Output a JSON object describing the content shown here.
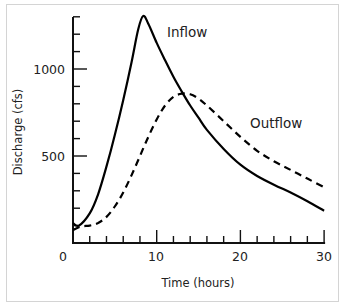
{
  "chart_data": {
    "type": "line",
    "title": "",
    "xlabel": "Time (hours)",
    "ylabel": "Discharge (cfs)",
    "xlim": [
      0,
      30
    ],
    "ylim": [
      0,
      1300
    ],
    "x_ticks": [
      0,
      10,
      20,
      30
    ],
    "x_tick_labels": [
      "0",
      "10",
      "20",
      "30"
    ],
    "x_minor_tick_step": 2,
    "y_ticks": [
      500,
      1000
    ],
    "y_tick_labels": [
      "500",
      "1000"
    ],
    "y_minor_tick_step": 100,
    "grid": false,
    "legend": "inline labels",
    "series": [
      {
        "name": "Inflow",
        "style": "solid",
        "color": "#000000",
        "x": [
          0,
          0.7,
          2,
          3,
          4,
          5,
          6,
          7,
          7.8,
          8.4,
          9,
          10,
          11,
          12,
          13,
          14,
          15,
          16,
          18,
          20,
          22,
          24,
          26,
          28,
          30
        ],
        "values": [
          115,
          100,
          170,
          280,
          440,
          620,
          820,
          1040,
          1230,
          1305,
          1260,
          1150,
          1050,
          955,
          870,
          790,
          720,
          650,
          540,
          450,
          385,
          335,
          290,
          240,
          185
        ]
      },
      {
        "name": "Outflow",
        "style": "dashed",
        "color": "#000000",
        "x": [
          0,
          1,
          2,
          3,
          4,
          5,
          6,
          7,
          8,
          9,
          10,
          11,
          12,
          13,
          14,
          15,
          16,
          18,
          20,
          22,
          24,
          26,
          28,
          30
        ],
        "values": [
          75,
          95,
          100,
          115,
          150,
          210,
          290,
          390,
          500,
          610,
          710,
          790,
          840,
          858,
          855,
          830,
          790,
          700,
          610,
          530,
          470,
          420,
          370,
          320
        ]
      }
    ],
    "annotations": [
      {
        "text": "Inflow",
        "x": 12.3,
        "y": 1230
      },
      {
        "text": "Outflow",
        "x": 22.5,
        "y": 700
      }
    ]
  },
  "labels": {
    "inflow": "Inflow",
    "outflow": "Outflow",
    "xlabel": "Time (hours)",
    "ylabel": "Discharge (cfs)",
    "xt0": "0",
    "xt10": "10",
    "xt20": "20",
    "xt30": "30",
    "yt500": "500",
    "yt1000": "1000"
  }
}
